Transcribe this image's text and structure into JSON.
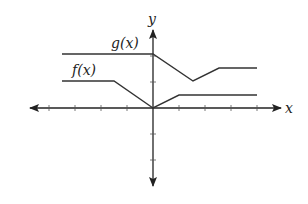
{
  "labels": {
    "x_axis": "x",
    "y_axis": "y",
    "g": "g(x)",
    "f": "f(x)"
  },
  "colors": {
    "line": "#333333",
    "axis": "#222222",
    "background": "#ffffff"
  },
  "axes": {
    "x_ticks": [
      -4,
      -3,
      -2,
      -1,
      1,
      2,
      3,
      4
    ],
    "y_ticks": [
      -2,
      -1,
      1,
      2
    ]
  },
  "functions": {
    "g": {
      "label": "g(x)",
      "points": [
        [
          -3.5,
          2
        ],
        [
          0,
          2
        ],
        [
          1.5,
          1
        ],
        [
          2.5,
          1.5
        ],
        [
          4,
          1.5
        ]
      ]
    },
    "f": {
      "label": "f(x)",
      "points": [
        [
          -3.5,
          1
        ],
        [
          -1.5,
          1
        ],
        [
          0,
          0
        ],
        [
          1,
          0.5
        ],
        [
          4,
          0.5
        ]
      ]
    }
  }
}
